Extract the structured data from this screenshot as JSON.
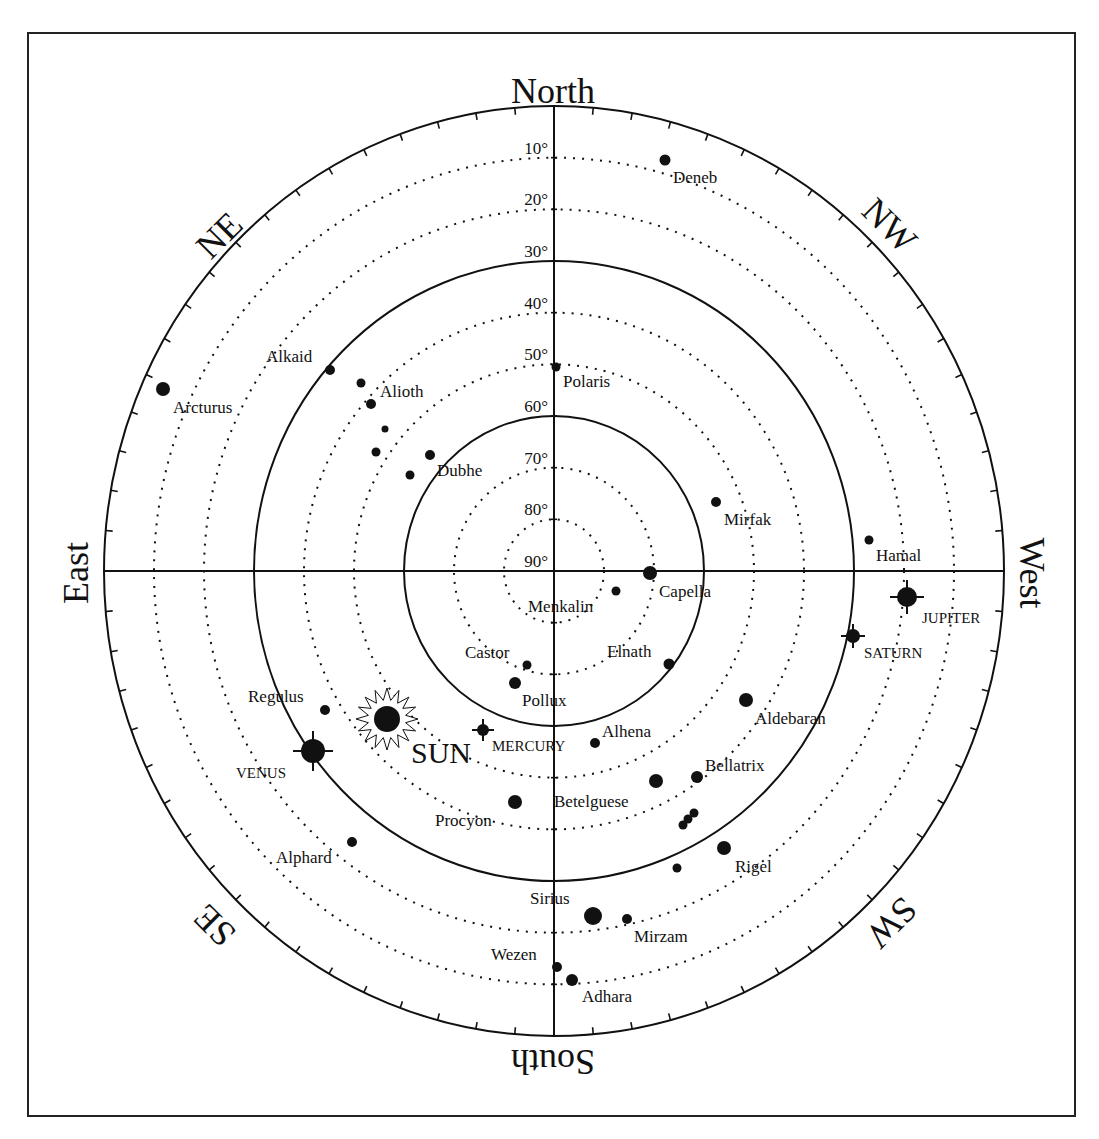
{
  "chart_data": {
    "type": "polar-star-map",
    "title": "",
    "center": [
      554,
      571
    ],
    "radius_x": 450,
    "radius_y": 465,
    "frame": {
      "x": 28,
      "y": 33,
      "width": 1047,
      "height": 1083
    },
    "directions": [
      {
        "label": "North",
        "x": 553,
        "y": 95,
        "rotate": 0
      },
      {
        "label": "NE",
        "x": 222,
        "y": 238,
        "rotate": -45
      },
      {
        "label": "East",
        "x": 80,
        "y": 573,
        "rotate": -90
      },
      {
        "label": "SE",
        "x": 217,
        "y": 923,
        "rotate": -135
      },
      {
        "label": "South",
        "x": 553,
        "y": 1058,
        "rotate": 180
      },
      {
        "label": "SW",
        "x": 889,
        "y": 920,
        "rotate": 135
      },
      {
        "label": "West",
        "x": 1028,
        "y": 573,
        "rotate": 90
      },
      {
        "label": "NW",
        "x": 887,
        "y": 228,
        "rotate": 45
      }
    ],
    "altitude_rings": [
      {
        "label": "10°",
        "alt": 10,
        "style": "dotted"
      },
      {
        "label": "20°",
        "alt": 20,
        "style": "dotted"
      },
      {
        "label": "30°",
        "alt": 30,
        "style": "solid"
      },
      {
        "label": "40°",
        "alt": 40,
        "style": "dotted"
      },
      {
        "label": "50°",
        "alt": 50,
        "style": "dotted"
      },
      {
        "label": "60°",
        "alt": 60,
        "style": "solid"
      },
      {
        "label": "70°",
        "alt": 70,
        "style": "dotted"
      },
      {
        "label": "80°",
        "alt": 80,
        "style": "dotted"
      },
      {
        "label": "90°",
        "alt": 90,
        "style": "none"
      }
    ],
    "tick_step_deg": 5,
    "stars": [
      {
        "name": "Deneb",
        "x": 665,
        "y": 160,
        "r": 5.5,
        "lx": 673,
        "ly": 183
      },
      {
        "name": "Arcturus",
        "x": 163,
        "y": 389,
        "r": 7,
        "lx": 173,
        "ly": 413
      },
      {
        "name": "Alkaid",
        "x": 330,
        "y": 370,
        "r": 5,
        "lx": 266,
        "ly": 362
      },
      {
        "name": "",
        "x": 361,
        "y": 383,
        "r": 4.5
      },
      {
        "name": "Alioth",
        "x": 371,
        "y": 404,
        "r": 5,
        "lx": 380,
        "ly": 397
      },
      {
        "name": "",
        "x": 385,
        "y": 429,
        "r": 3.5
      },
      {
        "name": "",
        "x": 376,
        "y": 452,
        "r": 4.5
      },
      {
        "name": "Dubhe",
        "x": 430,
        "y": 455,
        "r": 5,
        "lx": 437,
        "ly": 476
      },
      {
        "name": "",
        "x": 410,
        "y": 475,
        "r": 4.5
      },
      {
        "name": "Polaris",
        "x": 556,
        "y": 367,
        "r": 4.5,
        "lx": 563,
        "ly": 387
      },
      {
        "name": "Mirfak",
        "x": 716,
        "y": 502,
        "r": 5,
        "lx": 724,
        "ly": 525
      },
      {
        "name": "Hamal",
        "x": 869,
        "y": 540,
        "r": 4.5,
        "lx": 876,
        "ly": 561
      },
      {
        "name": "Capella",
        "x": 650,
        "y": 573,
        "r": 7,
        "lx": 659,
        "ly": 597
      },
      {
        "name": "Menkalin",
        "x": 616,
        "y": 591,
        "r": 4.5,
        "lx": 528,
        "ly": 612
      },
      {
        "name": "Castor",
        "x": 527,
        "y": 665,
        "r": 4.5,
        "lx": 465,
        "ly": 658
      },
      {
        "name": "Elnath",
        "x": 669,
        "y": 664,
        "r": 5.5,
        "lx": 607,
        "ly": 657
      },
      {
        "name": "Pollux",
        "x": 515,
        "y": 683,
        "r": 6,
        "lx": 522,
        "ly": 706
      },
      {
        "name": "Aldebaran",
        "x": 746,
        "y": 700,
        "r": 7,
        "lx": 755,
        "ly": 724
      },
      {
        "name": "Regulus",
        "x": 325,
        "y": 710,
        "r": 5,
        "lx": 248,
        "ly": 702
      },
      {
        "name": "Alhena",
        "x": 595,
        "y": 743,
        "r": 5,
        "lx": 602,
        "ly": 737
      },
      {
        "name": "Bellatrix",
        "x": 697,
        "y": 777,
        "r": 6,
        "lx": 705,
        "ly": 771
      },
      {
        "name": "Betelguese",
        "x": 656,
        "y": 781,
        "r": 7,
        "lx": 554,
        "ly": 807
      },
      {
        "name": "Procyon",
        "x": 515,
        "y": 802,
        "r": 7,
        "lx": 435,
        "ly": 826
      },
      {
        "name": "",
        "x": 683,
        "y": 825,
        "r": 4.5
      },
      {
        "name": "",
        "x": 688,
        "y": 819,
        "r": 4.5
      },
      {
        "name": "",
        "x": 694,
        "y": 813,
        "r": 4.5
      },
      {
        "name": "Alphard",
        "x": 352,
        "y": 842,
        "r": 5,
        "lx": 276,
        "ly": 863
      },
      {
        "name": "Rigel",
        "x": 724,
        "y": 848,
        "r": 7,
        "lx": 735,
        "ly": 872
      },
      {
        "name": "",
        "x": 677,
        "y": 868,
        "r": 4.5
      },
      {
        "name": "Sirius",
        "x": 593,
        "y": 916,
        "r": 9,
        "lx": 530,
        "ly": 904
      },
      {
        "name": "Mirzam",
        "x": 627,
        "y": 919,
        "r": 5,
        "lx": 634,
        "ly": 942
      },
      {
        "name": "Wezen",
        "x": 557,
        "y": 967,
        "r": 5,
        "lx": 491,
        "ly": 960
      },
      {
        "name": "Adhara",
        "x": 572,
        "y": 980,
        "r": 6,
        "lx": 582,
        "ly": 1002
      }
    ],
    "planets": [
      {
        "name": "JUPITER",
        "x": 907,
        "y": 597,
        "r": 10,
        "cross": 17,
        "lx": 922,
        "ly": 623
      },
      {
        "name": "SATURN",
        "x": 853,
        "y": 636,
        "r": 7,
        "cross": 12,
        "lx": 864,
        "ly": 658
      },
      {
        "name": "MERCURY",
        "x": 483,
        "y": 730,
        "r": 6,
        "cross": 11,
        "lx": 492,
        "ly": 751
      },
      {
        "name": "VENUS",
        "x": 313,
        "y": 751,
        "r": 12,
        "cross": 20,
        "lx": 236,
        "ly": 778
      }
    ],
    "sun": {
      "name": "SUN",
      "x": 387,
      "y": 719,
      "r": 13,
      "ray_outer": 31,
      "ray_inner": 19,
      "points": 16,
      "lx": 411,
      "ly": 763
    }
  }
}
